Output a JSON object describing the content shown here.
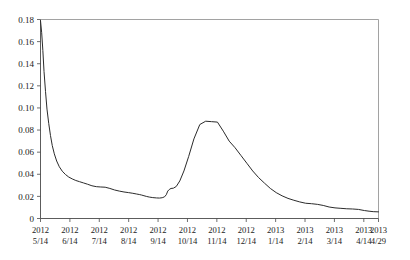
{
  "chart_data": {
    "type": "line",
    "title": "",
    "xlabel": "",
    "ylabel": "",
    "ylim": [
      0,
      0.18
    ],
    "yticks": [
      "0",
      "0.02",
      "0.04",
      "0.06",
      "0.08",
      "0.10",
      "0.12",
      "0.14",
      "0.16",
      "0.18"
    ],
    "ytick_values": [
      0,
      0.02,
      0.04,
      0.06,
      0.08,
      0.1,
      0.12,
      0.14,
      0.16,
      0.18
    ],
    "grid": false,
    "legend": false,
    "xtick_labels": [
      {
        "year": "2012",
        "day": "5/14"
      },
      {
        "year": "2012",
        "day": "6/14"
      },
      {
        "year": "2012",
        "day": "7/14"
      },
      {
        "year": "2012",
        "day": "8/14"
      },
      {
        "year": "2012",
        "day": "9/14"
      },
      {
        "year": "2012",
        "day": "10/14"
      },
      {
        "year": "2012",
        "day": "11/14"
      },
      {
        "year": "2012",
        "day": "12/14"
      },
      {
        "year": "2013",
        "day": "1/14"
      },
      {
        "year": "2013",
        "day": "2/14"
      },
      {
        "year": "2013",
        "day": "3/14"
      },
      {
        "year": "2013",
        "day": "4/14"
      },
      {
        "year": "2013",
        "day": "4/29"
      }
    ],
    "xtick_positions": [
      0,
      1,
      2,
      3,
      4,
      5,
      6,
      7,
      8,
      9,
      10,
      11,
      11.5
    ],
    "series": [
      {
        "name": "series-1",
        "color": "#2b2b2b",
        "x": [
          0.0,
          0.04,
          0.08,
          0.12,
          0.17,
          0.22,
          0.28,
          0.34,
          0.4,
          0.47,
          0.55,
          0.64,
          0.74,
          0.85,
          0.96,
          1.08,
          1.2,
          1.33,
          1.46,
          1.6,
          1.75,
          1.9,
          2.05,
          2.2,
          2.36,
          2.52,
          2.68,
          2.84,
          3.0,
          3.14,
          3.26,
          3.36,
          3.44,
          3.52,
          3.6,
          3.7,
          3.82,
          3.95,
          4.05,
          4.14,
          4.22,
          4.28,
          4.33,
          4.38,
          4.44,
          4.52,
          4.62,
          4.74,
          4.88,
          5.04,
          5.22,
          5.42,
          5.62,
          5.82,
          6.02,
          6.22,
          6.42,
          6.62,
          6.82,
          7.02,
          7.22,
          7.42,
          7.62,
          7.82,
          8.02,
          8.22,
          8.42,
          8.62,
          8.82,
          9.02,
          9.22,
          9.42,
          9.62,
          9.82,
          10.02,
          10.22,
          10.42,
          10.62,
          10.82,
          11.02,
          11.18,
          11.32,
          11.5
        ],
        "y": [
          0.179,
          0.168,
          0.152,
          0.133,
          0.115,
          0.099,
          0.086,
          0.075,
          0.066,
          0.0585,
          0.052,
          0.0468,
          0.0428,
          0.0398,
          0.0375,
          0.0358,
          0.0344,
          0.0333,
          0.0322,
          0.031,
          0.0296,
          0.0288,
          0.0285,
          0.0283,
          0.0272,
          0.0258,
          0.0248,
          0.024,
          0.0234,
          0.0228,
          0.0222,
          0.0217,
          0.0212,
          0.0206,
          0.02,
          0.0194,
          0.0189,
          0.0186,
          0.0185,
          0.0188,
          0.0196,
          0.0215,
          0.0248,
          0.0262,
          0.0272,
          0.0274,
          0.029,
          0.034,
          0.043,
          0.056,
          0.072,
          0.085,
          0.088,
          0.0876,
          0.0872,
          0.079,
          0.07,
          0.064,
          0.057,
          0.05,
          0.043,
          0.037,
          0.032,
          0.0272,
          0.0234,
          0.0205,
          0.0182,
          0.0165,
          0.015,
          0.0138,
          0.0134,
          0.0128,
          0.0118,
          0.0104,
          0.0096,
          0.0092,
          0.0088,
          0.0086,
          0.0082,
          0.0072,
          0.0066,
          0.0062,
          0.006
        ]
      }
    ]
  },
  "axes": {
    "x_min": 0,
    "x_max": 11.5
  }
}
